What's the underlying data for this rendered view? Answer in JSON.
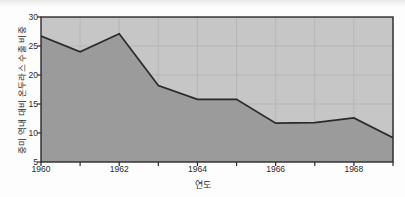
{
  "figure": {
    "title": "",
    "y_axis_title": "중미 역내 대비 온두라스 수출 비중",
    "x_axis_title": "연도",
    "colors": {
      "plot_background": "#c6c6c6",
      "area_fill": "#9b9b9b",
      "line": "#2a2a2a",
      "axis": "#2a2a2a",
      "grid": "#b2b2b2",
      "tick_text": "#2b2b2b",
      "page_background": "#fdfdfd"
    }
  },
  "chart_data": {
    "type": "area",
    "title": "",
    "xlabel": "연도",
    "ylabel": "중미 역내 대비 온두라스 수출 비중",
    "x": [
      1960,
      1961,
      1962,
      1963,
      1964,
      1965,
      1966,
      1967,
      1968,
      1969
    ],
    "values": [
      26.7,
      24.0,
      27.1,
      18.2,
      15.8,
      15.8,
      11.7,
      11.8,
      12.6,
      9.2
    ],
    "series": [
      {
        "name": "중미 역내 대비 온두라스 수출 비중",
        "values": [
          26.7,
          24.0,
          27.1,
          18.2,
          15.8,
          15.8,
          11.7,
          11.8,
          12.6,
          9.2
        ]
      }
    ],
    "xlim": [
      1960,
      1969
    ],
    "ylim": [
      5,
      30
    ],
    "ytick_labels": [
      "5",
      "10",
      "15",
      "20",
      "25",
      "30"
    ],
    "ytick_values": [
      5,
      10,
      15,
      20,
      25,
      30
    ],
    "xtick_labels": [
      "1960",
      "1962",
      "1964",
      "1966",
      "1968"
    ],
    "xtick_values": [
      1960,
      1962,
      1964,
      1966,
      1968
    ],
    "grid": true,
    "legend": "none"
  },
  "y_ticks": [
    {
      "label": "30",
      "value": 30
    },
    {
      "label": "25",
      "value": 25
    },
    {
      "label": "20",
      "value": 20
    },
    {
      "label": "15",
      "value": 15
    },
    {
      "label": "10",
      "value": 10
    },
    {
      "label": "5",
      "value": 5
    }
  ],
  "x_ticks": [
    {
      "label": "1960",
      "value": 1960
    },
    {
      "label": "1962",
      "value": 1962
    },
    {
      "label": "1964",
      "value": 1964
    },
    {
      "label": "1966",
      "value": 1966
    },
    {
      "label": "1968",
      "value": 1968
    }
  ]
}
